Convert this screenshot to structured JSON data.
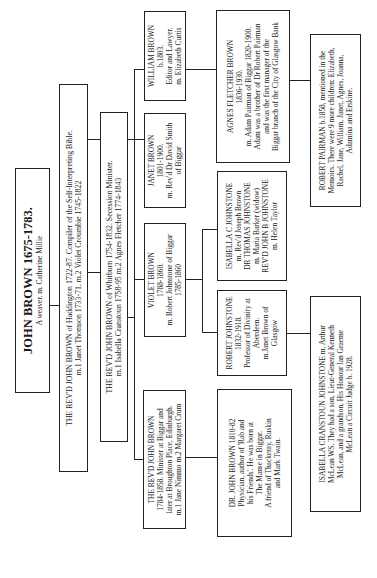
{
  "tree": {
    "root": {
      "name": "JOHN BROWN 1675-1783.",
      "lines": [
        "A weaver. m. Catherine Millie"
      ]
    },
    "gen2": {
      "lines": [
        "THE REV'D JOHN BROWN of Haddington 1722-87.  Compiler of the Self-Interpreting Bible.",
        "m.1 Janet Thomson 1733-71.    m.2 Violet Croumbie 1745-1822"
      ]
    },
    "gen3": {
      "lines": [
        "THE REV'D JOHN BROWN of Whitburn 1754-1832.  Secession Minister.",
        "m.1 Isabella Cranstoun 1758-95    m.2 Agnes Fletcher 1774-1843"
      ]
    },
    "gen4": [
      {
        "id": "revd-john-brown-1784",
        "lines": [
          "THE REV'D JOHN BROWN",
          "1784-1858.  Minister at Biggar and",
          "later at Broughton Place, Edinburgh.",
          "m.1 Jane Nimmo   m.2 Margaret Crum"
        ]
      },
      {
        "id": "violet-brown",
        "lines": [
          "VIOLET BROWN",
          "1788-1860.",
          "m. Robert Johnstone of Biggar",
          "1785-1860"
        ]
      },
      {
        "id": "janet-brown",
        "lines": [
          "JANET BROWN",
          "1801-1900.",
          "m. Rev'd Dr David Smith",
          "of Biggar"
        ]
      },
      {
        "id": "william-brown",
        "lines": [
          "WILLIAM BROWN",
          "b.1803.",
          "Editor and Lawyer.",
          "m. Elizabeth Curtis"
        ]
      }
    ],
    "gen5": [
      {
        "id": "dr-john-brown-1810",
        "lines": [
          "DR. JOHN BROWN 1810-82",
          "Physician, author of 'Rab and",
          "his Friends'. He was born at",
          "The Manse in Biggar.",
          "A friend of Thackeray, Ruskin",
          "and Mark Twain."
        ]
      },
      {
        "id": "robert-johnstone",
        "lines": [
          "ROBERT JOHNSTONE",
          "1832-1918.",
          "Professor of Divinity at",
          "Aberdeen.",
          "m.Janet Brown of",
          "Glasgow"
        ]
      },
      {
        "id": "isabella-c-johnstone",
        "lines": [
          "ISABELLA C JOHNSTONE",
          "m. Rev'd Joseph Brown",
          "DR THOMAS JOHNSTONE",
          "m. Maria Barker (widow)",
          "REV'D JOHN B JOHNSTONE",
          "m. Helen Taylor"
        ]
      },
      {
        "id": "agnes-fletcher-brown",
        "lines": [
          "AGNES FLETCHER BROWN",
          "1836-1930.",
          "m. Adam Pairman of Biggar 1820-1900.",
          "Adam was a brother of Dr Robert Pairman",
          "and was the first manager of the",
          "Biggar branch of the City of Glasgow Bank"
        ]
      }
    ],
    "gen6": [
      {
        "id": "isabella-cranstoun-johnstone",
        "lines": [
          "ISABELLA CRANSTOUN JOHNSTONE m. Arthur",
          "McLean WS.  They had a son, Lieut-General Kenneth",
          "McLean, and a grandson, His Honour Ian Graeme",
          "McLean a Circuit Judge b. 1928."
        ]
      },
      {
        "id": "robert-pairman",
        "lines": [
          "ROBERT PAIRMAN b.1858, mentioned in the",
          "Memoirs.  There were 9 more children: Elizabeth,",
          "Rachel, Jane, William, Janet, Agnes, Joanna,",
          "Adamina and Erskine."
        ]
      }
    ]
  }
}
